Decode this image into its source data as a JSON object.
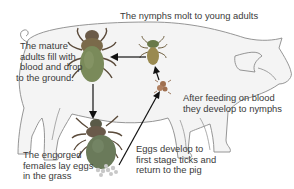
{
  "diagram": {
    "labels": {
      "top": "The nymphs molt to young adults",
      "adults": [
        "The mature",
        "adults fill with",
        "blood and drop",
        "to the ground."
      ],
      "feeding": [
        "After feeding on blood",
        "they develop to nymphs"
      ],
      "females": [
        "The engorged",
        "females lay eggs",
        "in the grass"
      ],
      "eggs": [
        "Eggs develop to",
        "first stage ticks and",
        "return to the pig"
      ]
    },
    "stages": [
      {
        "name": "mature-adult",
        "color": "#7a8a5a"
      },
      {
        "name": "young-nymph",
        "color": "#9a8a50"
      },
      {
        "name": "larva",
        "color": "#a07050"
      },
      {
        "name": "engorged-female",
        "color": "#6a7a5a"
      },
      {
        "name": "eggs",
        "color": "#c8c8c8"
      }
    ],
    "colors": {
      "outline": "#8a8a8a",
      "pig_fill": "#f4f4f4",
      "arrow": "#111111",
      "text": "#3a3a3a"
    }
  }
}
